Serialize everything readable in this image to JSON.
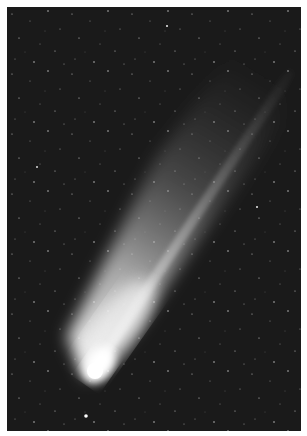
{
  "image": {
    "subject": "comet",
    "description": "Grayscale astrophotograph of a bright comet with a long diagonal tail against a star field",
    "colors": {
      "sky": "#1a1a1a",
      "coma": "#ffffff",
      "tail": "#d9d9d9",
      "border": "#ffffff"
    }
  }
}
